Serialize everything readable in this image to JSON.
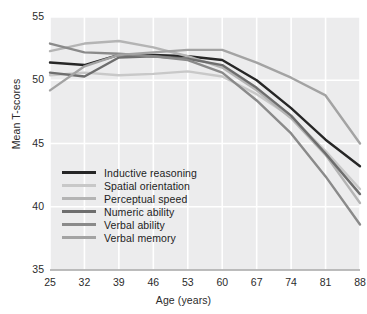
{
  "chart_data": {
    "type": "line",
    "title": "",
    "xlabel": "Age (years)",
    "ylabel": "Mean T-scores",
    "x": [
      25,
      32,
      39,
      46,
      53,
      60,
      67,
      74,
      81,
      88
    ],
    "xticklabels": [
      "25",
      "32",
      "39",
      "46",
      "53",
      "60",
      "67",
      "74",
      "81",
      "88"
    ],
    "yticklabels": [
      "35",
      "40",
      "45",
      "50",
      "55"
    ],
    "yticks": [
      35,
      40,
      45,
      50,
      55
    ],
    "xlim": [
      25,
      88
    ],
    "ylim": [
      35,
      55
    ],
    "grid": true,
    "grid_color": "#ffffff",
    "plot_background": "#ececed",
    "legend_position": "lower-left-inside",
    "series": [
      {
        "name": "Inductive reasoning",
        "color": "#262626",
        "values": [
          51.4,
          51.2,
          52.0,
          52.0,
          51.9,
          51.6,
          50.0,
          47.8,
          45.3,
          43.2
        ]
      },
      {
        "name": "Spatial orientation",
        "color": "#c8c8c8",
        "values": [
          50.4,
          50.6,
          50.4,
          50.5,
          50.7,
          50.3,
          48.9,
          47.1,
          44.4,
          41.4
        ]
      },
      {
        "name": "Perceptual speed",
        "color": "#b4b4b4",
        "values": [
          52.3,
          52.9,
          53.1,
          52.6,
          51.9,
          51.0,
          49.2,
          47.0,
          44.1,
          40.3
        ]
      },
      {
        "name": "Numeric ability",
        "color": "#6e6e6e",
        "values": [
          50.6,
          50.3,
          51.8,
          51.9,
          51.7,
          51.2,
          49.4,
          47.2,
          44.2,
          41.0
        ]
      },
      {
        "name": "Verbal ability",
        "color": "#8a8a8a",
        "values": [
          52.9,
          52.2,
          52.1,
          51.9,
          51.6,
          50.6,
          48.4,
          45.8,
          42.4,
          38.6
        ]
      },
      {
        "name": "Verbal memory",
        "color": "#a3a3a3",
        "values": [
          49.2,
          51.1,
          52.0,
          52.2,
          52.4,
          52.4,
          51.4,
          50.2,
          48.8,
          45.0
        ]
      }
    ]
  }
}
